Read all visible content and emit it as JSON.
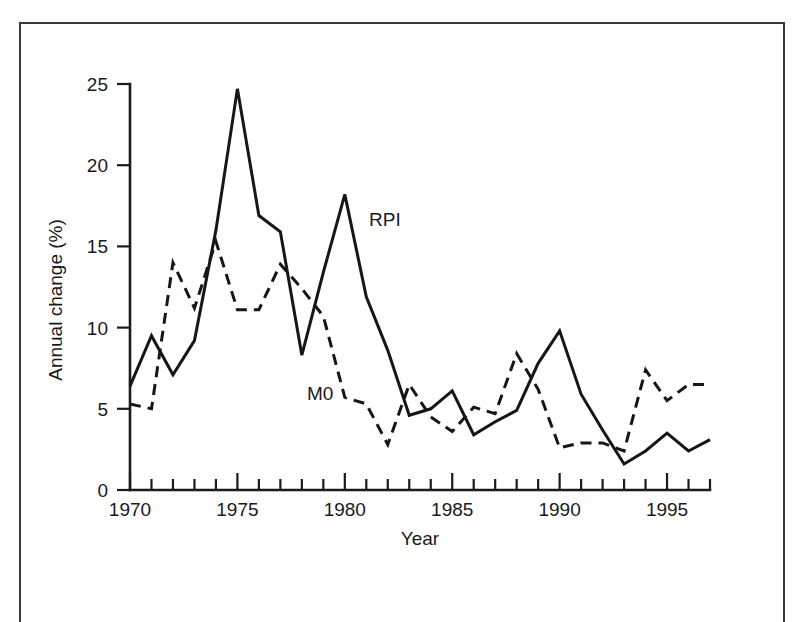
{
  "figure": {
    "frame_color": "#3a3a3a",
    "background": "#ffffff"
  },
  "axes": {
    "y_title": "Annual change (%)",
    "x_title": "Year",
    "y_ticks": [
      "0",
      "5",
      "10",
      "15",
      "20",
      "25"
    ],
    "x_ticks_labeled": [
      "1970",
      "1975",
      "1980",
      "1985",
      "1990",
      "1995"
    ]
  },
  "labels": {
    "rpi": "RPI",
    "m0": "M0"
  },
  "chart_data": {
    "type": "line",
    "title": "",
    "xlabel": "Year",
    "ylabel": "Annual change (%)",
    "xlim": [
      1970,
      1997
    ],
    "ylim": [
      0,
      25
    ],
    "yticks": [
      0,
      5,
      10,
      15,
      20,
      25
    ],
    "xticks_labeled": [
      1970,
      1975,
      1980,
      1985,
      1990,
      1995
    ],
    "xtick_interval": 1,
    "grid": false,
    "legend_position": "inline-annotation",
    "line_color": "#161616",
    "x": [
      1970,
      1971,
      1972,
      1973,
      1974,
      1975,
      1976,
      1977,
      1978,
      1979,
      1980,
      1981,
      1982,
      1983,
      1984,
      1985,
      1986,
      1987,
      1988,
      1989,
      1990,
      1991,
      1992,
      1993,
      1994,
      1995,
      1996,
      1997
    ],
    "series": [
      {
        "name": "RPI",
        "style": "solid",
        "annotation": "RPI",
        "values": [
          6.4,
          9.5,
          7.1,
          9.2,
          16.0,
          24.7,
          16.9,
          15.9,
          8.3,
          13.4,
          18.2,
          11.9,
          8.6,
          4.6,
          5.0,
          6.1,
          3.4,
          4.2,
          4.9,
          7.8,
          9.8,
          5.9,
          3.7,
          1.6,
          2.4,
          3.5,
          2.4,
          3.1
        ]
      },
      {
        "name": "M0",
        "style": "dashed",
        "annotation": "M0",
        "values": [
          5.3,
          5.0,
          14.0,
          11.2,
          15.3,
          11.1,
          11.1,
          13.9,
          12.4,
          10.7,
          5.7,
          5.3,
          2.8,
          6.5,
          4.5,
          3.6,
          5.1,
          4.7,
          8.4,
          6.2,
          2.6,
          2.9,
          2.9,
          2.4,
          7.4,
          5.5,
          6.5,
          6.5
        ]
      }
    ]
  }
}
